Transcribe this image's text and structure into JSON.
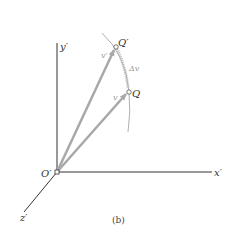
{
  "figure": {
    "caption": "(b)",
    "origin_label": "O′",
    "axes": {
      "x_label": "x′",
      "y_label": "y′",
      "z_label": "z′"
    },
    "points": {
      "q_prime_label": "Q′",
      "q_label": "Q"
    },
    "vectors": {
      "v_prime_label": "v′",
      "v_label": "v",
      "delta_v_label": "Δv"
    },
    "colors": {
      "axis": "#333333",
      "vector": "#a8a8a8",
      "arc": "#9a9a9a",
      "delta": "#b0b0b0"
    }
  }
}
